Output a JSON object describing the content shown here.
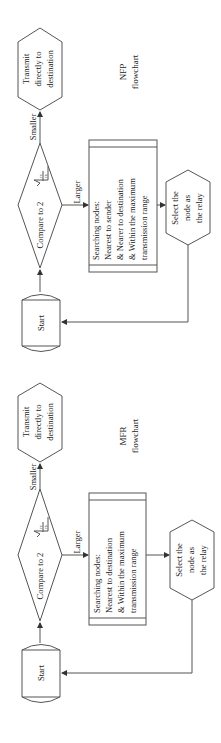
{
  "diagram": {
    "orientation": "rotated-90-ccw",
    "stroke_color": "#555555",
    "text_color": "#222222",
    "flowcharts": [
      {
        "id": "nfp",
        "caption": [
          "NFP",
          "flowchart"
        ],
        "start": "Start",
        "decision": {
          "prefix": "Compare to 2",
          "formula": "√(r_c/r_s)",
          "num": "rc",
          "den": "rs"
        },
        "branch_smaller": "Smaller",
        "branch_larger": "Larger",
        "transmit": [
          "Transmit",
          "directly to",
          "destination"
        ],
        "search": [
          "Searching nodes:",
          "Nearest to sender",
          "& Nearer to destination",
          "& Within the maximum",
          "transmission range"
        ],
        "select": [
          "Select the",
          "node as",
          "the relay"
        ]
      },
      {
        "id": "mfr",
        "caption": [
          "MFR",
          "flowchart"
        ],
        "start": "Start",
        "decision": {
          "prefix": "Compare to 2",
          "formula": "√(r_c/r_s)",
          "num": "rc",
          "den": "rs"
        },
        "branch_smaller": "Smaller",
        "branch_larger": "Larger",
        "transmit": [
          "Transmit",
          "directly to",
          "destination"
        ],
        "search": [
          "Searching nodes:",
          "Nearest to destination",
          "& Within the maximum",
          "transmission range"
        ],
        "select": [
          "Select the",
          "node as",
          "the relay"
        ]
      }
    ]
  }
}
